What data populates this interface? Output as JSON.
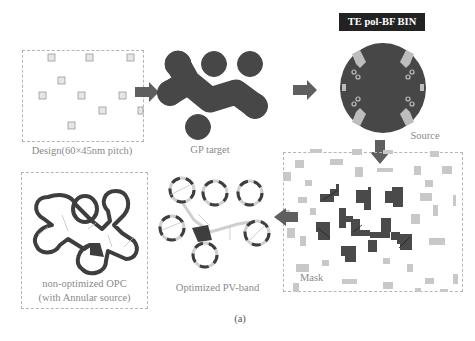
{
  "colors": {
    "dark_fill": "#4a4a4a",
    "arrow": "#5f5f5f",
    "light_rect": "#c8c8c8",
    "dashed_border": "#b5b5b5",
    "label_text": "#8a8a8a",
    "badge_bg": "#222222",
    "badge_text": "#ffffff"
  },
  "panels": {
    "design": {
      "label": "Design(60×45nm pitch)"
    },
    "gp_target": {
      "label": "GP target"
    },
    "source": {
      "badge": "TE pol-BF BIN",
      "label": "Source"
    },
    "mask": {
      "label": "Mask"
    },
    "optimized": {
      "label": "Optimized PV-band"
    },
    "non_optimized": {
      "label_line1": "non-optimized OPC",
      "label_line2": "(with Annular source)"
    }
  },
  "caption": "(a)",
  "flow": [
    "Design",
    "GP target",
    "Source",
    "Mask",
    "Optimized PV-band"
  ]
}
